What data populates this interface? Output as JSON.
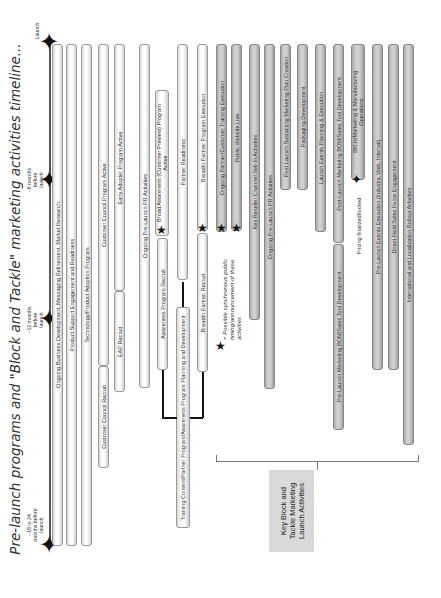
{
  "title": "Pre-launch programs and \"Block and Tackle\" marketing activities timeline...",
  "milestones": [
    {
      "label": "Launch",
      "icon": "four-point-star-icon"
    },
    {
      "label": "~6 months before launch",
      "icon": "four-point-star-icon"
    },
    {
      "label": "~12 months before launch",
      "icon": "four-point-star-icon"
    },
    {
      "label": "~18 to 24 months before launch",
      "icon": "four-point-star-icon"
    }
  ],
  "bars": [
    {
      "label": "Ongoing Business Development, Messaging Refinement, Market Research",
      "style": "light"
    },
    {
      "label": "Product Support Engagement and Readiness",
      "style": "light"
    },
    {
      "label": "Technology/Product Adoption Program",
      "style": "light"
    },
    {
      "label": "Customer Council Program Active",
      "style": "light"
    },
    {
      "label": "Customer Council Recruit",
      "style": "light"
    },
    {
      "label": "Early Adopter Program Active",
      "style": "light"
    },
    {
      "label": "EAP Recruit",
      "style": "light"
    },
    {
      "label": "Ongoing Pre-Launch PR Activities",
      "style": "light"
    },
    {
      "label": "Broad Awareness (Customer Preview) Program Active",
      "style": "light"
    },
    {
      "label": "Awareness Program Recruit",
      "style": "light"
    },
    {
      "label": "Partner Readiness",
      "style": "light"
    },
    {
      "label": "Training Content/Partner Program/Awareness Program Planning and Development",
      "style": "light"
    },
    {
      "label": "Breadth Partner Program Execution",
      "style": "light"
    },
    {
      "label": "Breadth Partner Recruit",
      "style": "light"
    },
    {
      "label": "Ongoing Partner/Customer Training Execution",
      "style": "grey"
    },
    {
      "label": "Public Website Live",
      "style": "grey"
    },
    {
      "label": "Key Reseller Channel Sell-In Activities",
      "style": "grey"
    },
    {
      "label": "Ongoing Pre-Launch PR Activities",
      "style": "grey"
    },
    {
      "label": "Post Launch Sustaining Marketing Plan Creation",
      "style": "grey"
    },
    {
      "label": "Packaging Development",
      "style": "grey"
    },
    {
      "label": "Launch Events Planning & Execution",
      "style": "grey"
    },
    {
      "label": "Post-Launch Marketing BOM/Sales Tool Development",
      "style": "grey"
    },
    {
      "label": "Pre-Launch Marketing BOM/Sales Tool Development",
      "style": "grey"
    },
    {
      "label": "SKUs/Marketing & Manufacturing Operations",
      "style": "grey"
    },
    {
      "label": "Pre-Launch Events Execution (Industry, Web, Internal)",
      "style": "grey"
    },
    {
      "label": "Direct Field Sales Force Engagement",
      "style": "grey"
    },
    {
      "label": "International and Localization Rollout Activities",
      "style": "grey"
    }
  ],
  "annotations": {
    "star_note": "= Possible synchronous public timing/announcement of these activities",
    "pricing": "Pricing finalized/locked",
    "key_box": "Key Block and Tackle Marketing Launch Activities"
  },
  "icons": {
    "star": "★",
    "milestone": "✦"
  }
}
